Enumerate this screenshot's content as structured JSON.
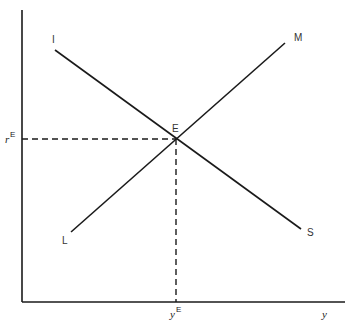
{
  "diagram": {
    "axes": {
      "x_label": "y",
      "y_label": "r"
    },
    "curves": [
      {
        "name": "IS",
        "start_label": "I",
        "end_label": "S"
      },
      {
        "name": "LM",
        "start_label": "L",
        "end_label": "M"
      }
    ],
    "equilibrium": {
      "label": "E",
      "r_label_base": "r",
      "r_label_sup": "E",
      "y_label_base": "y",
      "y_label_sup": "E"
    },
    "colors": {
      "line": "#1a1a1a",
      "label": "#333333"
    }
  }
}
